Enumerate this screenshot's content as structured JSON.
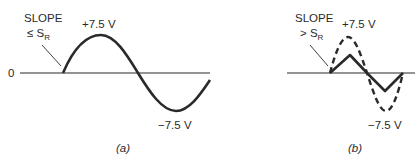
{
  "panels": [
    {
      "id": "a",
      "caption": "(a)",
      "zero_label": "0",
      "slope_label": "SLOPE",
      "slope_condition": "≤ S",
      "slope_subscript": "R",
      "peak_label": "+7.5 V",
      "trough_label": "−7.5 V",
      "waveform": "sine, full amplitude (solid)"
    },
    {
      "id": "b",
      "caption": "(b)",
      "slope_label": "SLOPE",
      "slope_condition": "> S",
      "slope_subscript": "R",
      "peak_label": "+7.5 V",
      "trough_label": "−7.5 V",
      "waveform": "ideal sine (dashed) vs slew-rate-limited triangle (solid)"
    }
  ],
  "colors": {
    "line": "#2a2a2a",
    "background": "#ffffff"
  }
}
